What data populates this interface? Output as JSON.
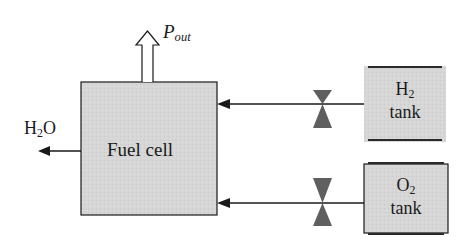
{
  "diagram": {
    "type": "block-diagram",
    "colors": {
      "block_fill": "#d6d6d6",
      "stroke": "#1a1a1a",
      "valve_fill": "#5f5f5f",
      "arrow_outline_fill": "#ffffff"
    },
    "fuel_cell": {
      "label": "Fuel cell"
    },
    "output": {
      "symbol": "P",
      "subscript": "out"
    },
    "exhaust": {
      "base": "H",
      "subscript": "2",
      "suffix": "O"
    },
    "h2_tank": {
      "base": "H",
      "subscript": "2",
      "label": "tank"
    },
    "o2_tank": {
      "base": "O",
      "subscript": "2",
      "label": "tank"
    },
    "valves": [
      {
        "name": "h2-valve",
        "icon": "valve-icon"
      },
      {
        "name": "o2-valve",
        "icon": "valve-icon"
      }
    ],
    "connections": [
      {
        "from": "H2 tank",
        "to": "Fuel cell",
        "via": "h2-valve"
      },
      {
        "from": "O2 tank",
        "to": "Fuel cell",
        "via": "o2-valve"
      },
      {
        "from": "Fuel cell",
        "to": "H2O"
      },
      {
        "from": "Fuel cell",
        "to": "Pout"
      }
    ]
  }
}
